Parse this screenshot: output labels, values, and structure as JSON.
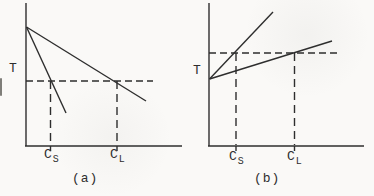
{
  "figure": {
    "panels": [
      {
        "id": "a",
        "caption": "(a)",
        "y_axis_label": "T",
        "x_labels": [
          {
            "base": "C",
            "sub": "S"
          },
          {
            "base": "C",
            "sub": "L"
          }
        ]
      },
      {
        "id": "b",
        "caption": "(b)",
        "y_axis_label": "T",
        "x_labels": [
          {
            "base": "C",
            "sub": "S"
          },
          {
            "base": "C",
            "sub": "L"
          }
        ]
      }
    ],
    "colors": {
      "ink": "#2e2e2e",
      "paper": "#faf9f7"
    }
  }
}
